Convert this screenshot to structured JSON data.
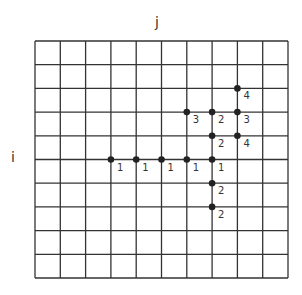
{
  "axes": {
    "column_label": "j",
    "row_label": "i"
  },
  "grid": {
    "columns": 10,
    "rows": 10,
    "left": 35,
    "top": 41,
    "right": 288,
    "bottom": 278,
    "line_color": "#333333"
  },
  "points": [
    {
      "row": 5,
      "col": 3,
      "label": "1"
    },
    {
      "row": 5,
      "col": 4,
      "label": "1"
    },
    {
      "row": 5,
      "col": 5,
      "label": "1"
    },
    {
      "row": 5,
      "col": 6,
      "label": "1"
    },
    {
      "row": 5,
      "col": 7,
      "label": "1"
    },
    {
      "row": 6,
      "col": 7,
      "label": "2"
    },
    {
      "row": 7,
      "col": 7,
      "label": "2"
    },
    {
      "row": 4,
      "col": 7,
      "label": "2"
    },
    {
      "row": 3,
      "col": 7,
      "label": "2"
    },
    {
      "row": 3,
      "col": 6,
      "label": "3"
    },
    {
      "row": 3,
      "col": 8,
      "label": "3"
    },
    {
      "row": 4,
      "col": 8,
      "label": "4"
    },
    {
      "row": 2,
      "col": 8,
      "label": "4"
    }
  ],
  "point_color": "#222222"
}
